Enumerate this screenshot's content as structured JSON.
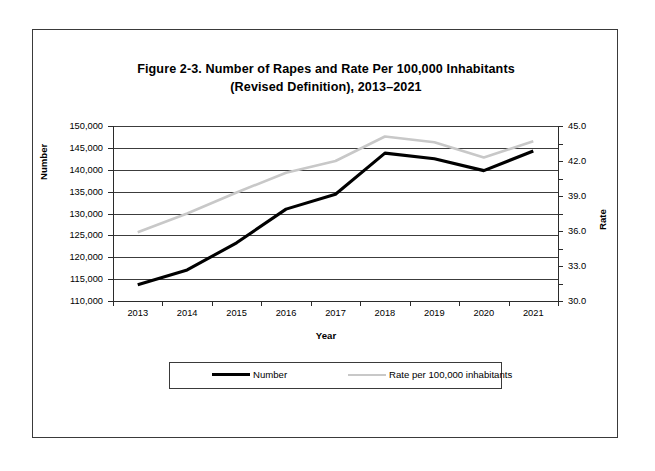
{
  "chart_data": {
    "type": "line",
    "title": "Figure 2-3. Number of Rapes and Rate Per 100,000 Inhabitants",
    "subtitle": "(Revised Definition), 2013–2021",
    "xlabel": "Year",
    "ylabel": "Number",
    "y2label": "Rate",
    "categories": [
      "2013",
      "2014",
      "2015",
      "2016",
      "2017",
      "2018",
      "2019",
      "2020",
      "2021"
    ],
    "ylim": [
      110000,
      150000
    ],
    "ytick_step": 5000,
    "yticks": [
      "110,000",
      "115,000",
      "120,000",
      "125,000",
      "130,000",
      "135,000",
      "140,000",
      "145,000",
      "150,000"
    ],
    "ytick_values": [
      110000,
      115000,
      120000,
      125000,
      130000,
      135000,
      140000,
      145000,
      150000
    ],
    "y2lim": [
      30.0,
      45.0
    ],
    "y2tick_step": 3.0,
    "y2ticks": [
      "30.0",
      "33.0",
      "36.0",
      "39.0",
      "42.0",
      "45.0"
    ],
    "y2tick_values": [
      30.0,
      33.0,
      36.0,
      39.0,
      42.0,
      45.0
    ],
    "y2_minor_step": 1.5,
    "grid": "horizontal",
    "legend_position": "bottom",
    "series": [
      {
        "name": "Number",
        "axis": "left",
        "color": "#000000",
        "values": [
          113700,
          117100,
          123300,
          131000,
          134400,
          143800,
          142500,
          139800,
          144300
        ]
      },
      {
        "name": "Rate per 100,000 inhabitants",
        "axis": "right",
        "color": "#c8c8c8",
        "values": [
          35.9,
          37.5,
          39.3,
          41.0,
          42.0,
          44.1,
          43.6,
          42.3,
          43.7
        ]
      }
    ]
  },
  "legend": {
    "number_label": "Number",
    "rate_label": "Rate per 100,000 inhabitants"
  }
}
